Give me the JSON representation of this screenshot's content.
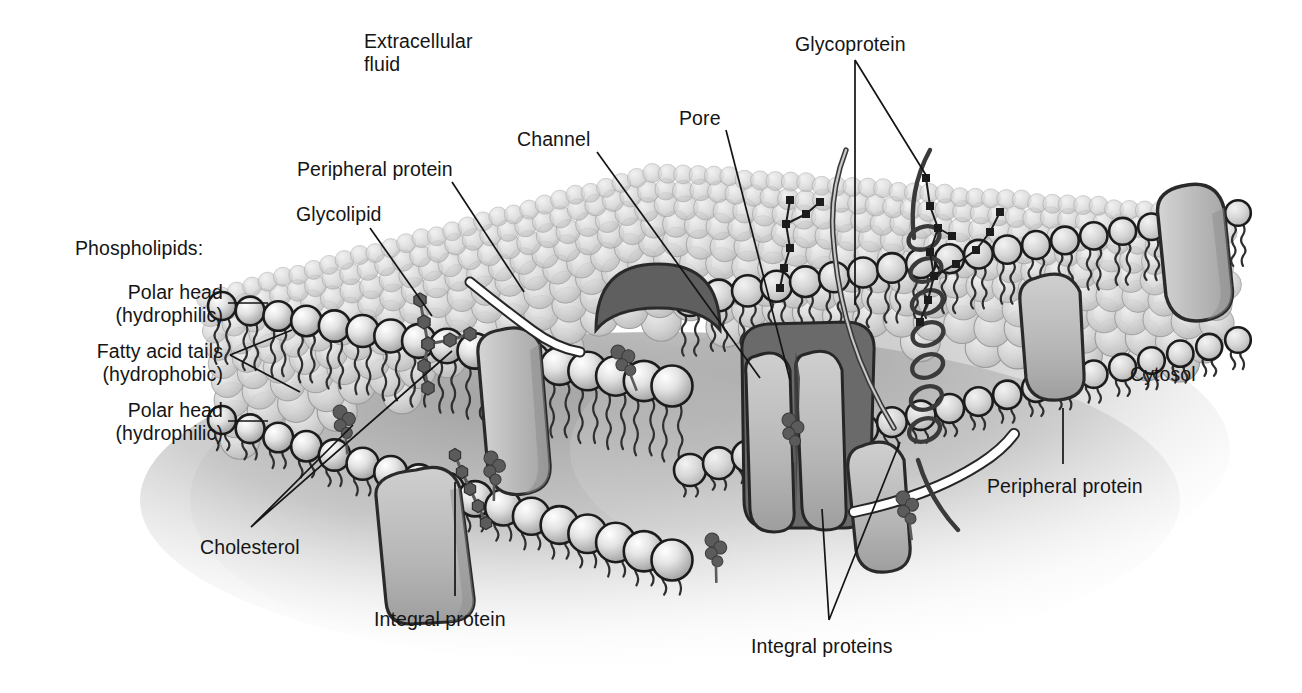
{
  "figure": {
    "type": "biological-diagram",
    "background": "#ffffff",
    "ink": "#151515"
  },
  "palette": {
    "outline": "#1c1c1c",
    "head_light": "#f4f4f4",
    "head_mid": "#c9c9c9",
    "head_dark": "#9a9a9a",
    "surface_sphere": "#d2d2d2",
    "protein_fill": "#b9b9b9",
    "protein_dark": "#6e6e6e",
    "channel_dark": "#6a6a6a",
    "cholesterol": "#5b5b5b",
    "cytosol_shadow": "#b4b4b4",
    "peripheral_white": "#ffffff"
  },
  "labels": [
    {
      "id": "extracellular-fluid",
      "text": "Extracellular\nfluid",
      "x": 364,
      "y": 30,
      "align": "left"
    },
    {
      "id": "glycoprotein",
      "text": "Glycoprotein",
      "x": 795,
      "y": 33,
      "align": "left"
    },
    {
      "id": "channel",
      "text": "Channel",
      "x": 517,
      "y": 128,
      "align": "left"
    },
    {
      "id": "pore",
      "text": "Pore",
      "x": 679,
      "y": 107,
      "align": "left"
    },
    {
      "id": "peripheral-protein-top",
      "text": "Peripheral protein",
      "x": 297,
      "y": 158,
      "align": "left"
    },
    {
      "id": "glycolipid",
      "text": "Glycolipid",
      "x": 296,
      "y": 203,
      "align": "left"
    },
    {
      "id": "phospholipids",
      "text": "Phospholipids:",
      "x": 75,
      "y": 237,
      "align": "left"
    },
    {
      "id": "polar-head-top",
      "text": "Polar head\n(hydrophilic)",
      "x": 68,
      "y": 281,
      "align": "right",
      "w": 155
    },
    {
      "id": "fatty-acid-tails",
      "text": "Fatty acid tails\n(hydrophobic)",
      "x": 58,
      "y": 340,
      "align": "right",
      "w": 165
    },
    {
      "id": "polar-head-bottom",
      "text": "Polar head\n(hydrophilic)",
      "x": 68,
      "y": 399,
      "align": "right",
      "w": 155
    },
    {
      "id": "cholesterol",
      "text": "Cholesterol",
      "x": 200,
      "y": 536,
      "align": "left"
    },
    {
      "id": "integral-protein",
      "text": "Integral protein",
      "x": 374,
      "y": 608,
      "align": "left"
    },
    {
      "id": "integral-proteins",
      "text": "Integral proteins",
      "x": 751,
      "y": 635,
      "align": "left"
    },
    {
      "id": "peripheral-protein-right",
      "text": "Peripheral protein",
      "x": 987,
      "y": 475,
      "align": "left"
    },
    {
      "id": "cytosol",
      "text": "Cytosol",
      "x": 1130,
      "y": 363,
      "align": "left"
    }
  ],
  "structures": {
    "bilayer": {
      "name": "phospholipid bilayer",
      "outer_leaflet": "polar heads facing extracellular fluid",
      "inner_leaflet": "polar heads facing cytosol",
      "core": "fatty acid tails (hydrophobic)"
    },
    "membrane_proteins": [
      {
        "name": "integral protein",
        "count": 4,
        "description": "spans bilayer"
      },
      {
        "name": "peripheral protein",
        "count": 2,
        "description": "attached to surface"
      },
      {
        "name": "channel protein",
        "count": 1,
        "description": "forms aqueous pore"
      },
      {
        "name": "glycoprotein",
        "count": 2,
        "description": "protein with carbohydrate chain"
      },
      {
        "name": "glycolipid",
        "count": 2,
        "description": "lipid with carbohydrate chain"
      },
      {
        "name": "cholesterol",
        "count": 6,
        "description": "between fatty acid tails"
      }
    ]
  }
}
